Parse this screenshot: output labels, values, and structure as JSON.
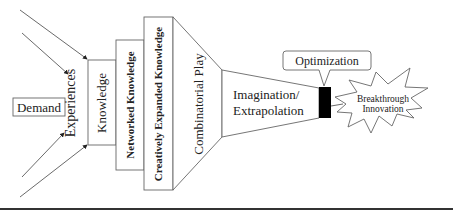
{
  "diagram": {
    "nodes": {
      "demand": "Demand",
      "experiences": "Experiences",
      "knowledge": "Knowledge",
      "networked_knowledge": "Networked Knowledge",
      "creatively_expanded_knowledge": "Creatively Expanded Knowledge",
      "combinatorial_play": "Combinatorial Play",
      "imagination_line1": "Imagination/",
      "imagination_line2": "Extrapolation",
      "optimization": "Optimization",
      "breakthrough_line1": "Breakthrough",
      "breakthrough_line2": "Innovation"
    },
    "colors": {
      "stroke": "#444444",
      "optimization_block": "#000000",
      "rule": "#333333"
    }
  }
}
